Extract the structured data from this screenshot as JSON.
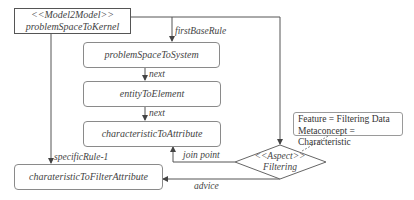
{
  "diagram": {
    "nodes": {
      "root": {
        "stereotype": "<<Model2Model>>",
        "name": "problemSpaceToKernel"
      },
      "n1": {
        "name": "problemSpaceToSystem"
      },
      "n2": {
        "name": "entityToElement"
      },
      "n3": {
        "name": "characteristicToAttribute"
      },
      "n4": {
        "name": "charateristicToFilterAttribute"
      },
      "aspect": {
        "stereotype": "<<Aspect>>",
        "name": "Filtering"
      }
    },
    "edges": {
      "first_base_rule": "firstBaseRule",
      "next1": "next",
      "next2": "next",
      "specific_rule": "specificRule-1",
      "join_point": "join point",
      "advice": "advice"
    },
    "note": {
      "line1": "Feature = Filtering Data",
      "line2": "Metaconcept = Characteristic"
    },
    "colors": {
      "line": "#555555",
      "box_border": "#8a8a8a"
    }
  }
}
